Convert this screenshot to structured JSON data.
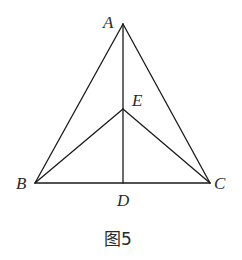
{
  "figure": {
    "caption": "图5",
    "points": {
      "A": {
        "label": "A",
        "x": 123,
        "y": 24,
        "label_x": 103,
        "label_y": 28
      },
      "E": {
        "label": "E",
        "x": 123,
        "y": 109,
        "label_x": 132,
        "label_y": 106
      },
      "B": {
        "label": "B",
        "x": 35,
        "y": 183,
        "label_x": 16,
        "label_y": 189
      },
      "C": {
        "label": "C",
        "x": 210,
        "y": 183,
        "label_x": 214,
        "label_y": 189
      },
      "D": {
        "label": "D",
        "x": 123,
        "y": 183,
        "label_x": 117,
        "label_y": 206
      }
    },
    "segments": [
      {
        "name": "segment-AB",
        "from": "A",
        "to": "B"
      },
      {
        "name": "segment-AC",
        "from": "A",
        "to": "C"
      },
      {
        "name": "segment-BC",
        "from": "B",
        "to": "C"
      },
      {
        "name": "segment-AD",
        "from": "A",
        "to": "D"
      },
      {
        "name": "segment-EB",
        "from": "E",
        "to": "B"
      },
      {
        "name": "segment-EC",
        "from": "E",
        "to": "C"
      }
    ],
    "stroke_color": "#1a1a1a",
    "text_color": "#2a2a2a"
  }
}
